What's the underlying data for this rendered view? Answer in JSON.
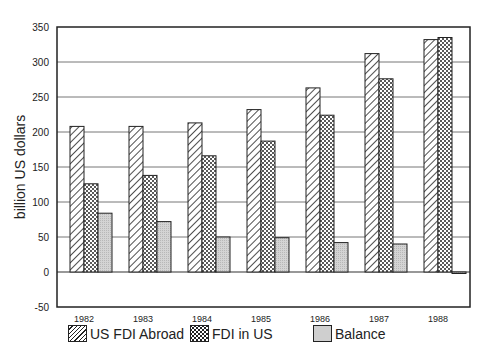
{
  "chart_data": {
    "type": "bar",
    "title": "",
    "xlabel": "",
    "ylabel": "billion US dollars",
    "ylim": [
      -50,
      350
    ],
    "yticks": [
      -50,
      0,
      50,
      100,
      150,
      200,
      250,
      300,
      350
    ],
    "grid": true,
    "legend_position": "bottom",
    "categories": [
      "1982",
      "1983",
      "1984",
      "1985",
      "1986",
      "1987",
      "1988"
    ],
    "series": [
      {
        "name": "US FDI Abroad",
        "pattern": "diagonal-hatch",
        "values": [
          208,
          208,
          213,
          232,
          263,
          312,
          332
        ]
      },
      {
        "name": "FDI in US",
        "pattern": "cross-hatch",
        "values": [
          126,
          138,
          166,
          187,
          224,
          276,
          335
        ]
      },
      {
        "name": "Balance",
        "pattern": "gray-fill",
        "color": "#cfcfcf",
        "values": [
          84,
          72,
          50,
          49,
          42,
          40,
          -2
        ]
      }
    ]
  },
  "legend": {
    "items": [
      {
        "label": "US FDI Abroad"
      },
      {
        "label": "FDI in US"
      },
      {
        "label": "Balance"
      }
    ]
  }
}
